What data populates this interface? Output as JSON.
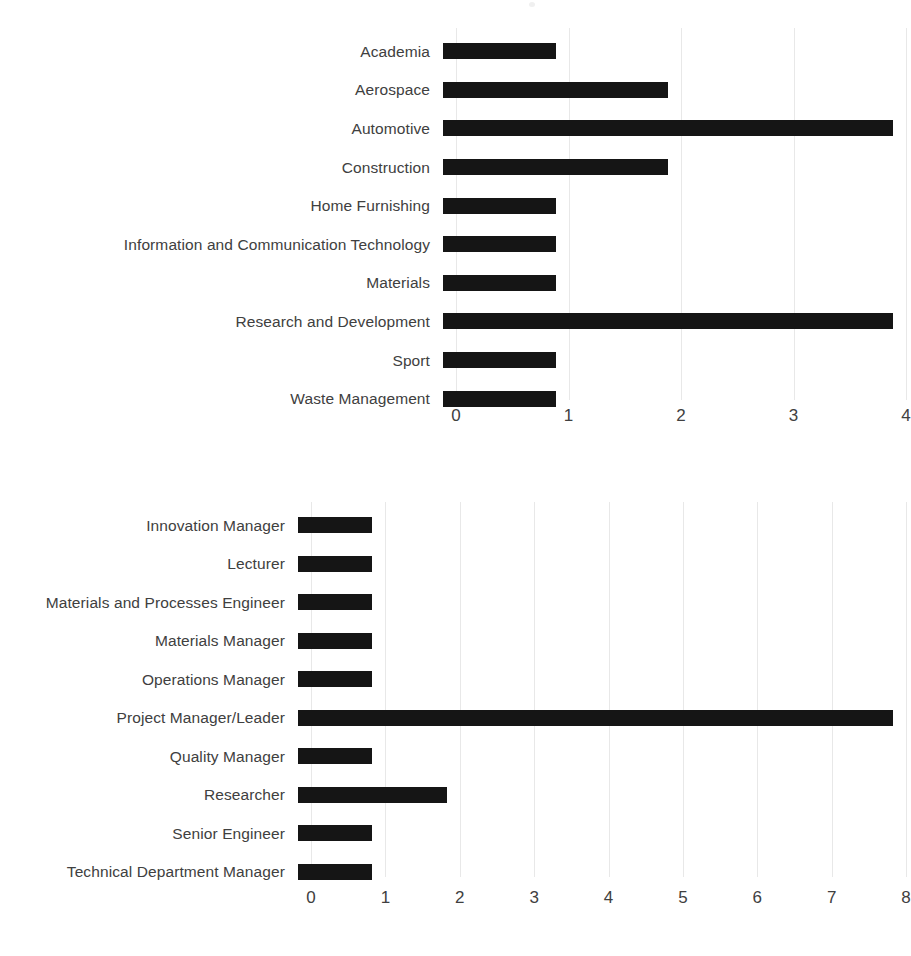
{
  "document": {
    "background_color": "#ffffff",
    "text_color": "#404040",
    "bar_color": "#151515",
    "gridline_color": "#e8e8e8"
  },
  "chart_data": [
    {
      "id": "industry",
      "type": "bar",
      "orientation": "horizontal",
      "title": "",
      "subtitle": "",
      "xlabel": "",
      "ylabel": "",
      "xlim": [
        0,
        4
      ],
      "ylim": null,
      "grid": true,
      "legend": false,
      "legend_position": "none",
      "xticks": [
        "0",
        "1",
        "2",
        "3",
        "4"
      ],
      "xtick_values": [
        0,
        1,
        2,
        3,
        4
      ],
      "categories": [
        "Academia",
        "Aerospace",
        "Automotive",
        "Construction",
        "Home Furnishing",
        "Information and Communication Technology",
        "Materials",
        "Research and Development",
        "Sport",
        "Waste Management"
      ],
      "values": [
        1,
        2,
        4,
        2,
        1,
        1,
        1,
        4,
        1,
        1
      ]
    },
    {
      "id": "role",
      "type": "bar",
      "orientation": "horizontal",
      "title": "",
      "subtitle": "",
      "xlabel": "",
      "ylabel": "",
      "xlim": [
        0,
        8
      ],
      "ylim": null,
      "grid": true,
      "legend": false,
      "legend_position": "none",
      "xticks": [
        "0",
        "1",
        "2",
        "3",
        "4",
        "5",
        "6",
        "7",
        "8"
      ],
      "xtick_values": [
        0,
        1,
        2,
        3,
        4,
        5,
        6,
        7,
        8
      ],
      "categories": [
        "Innovation Manager",
        "Lecturer",
        "Materials and Processes Engineer",
        "Materials Manager",
        "Operations Manager",
        "Project Manager/Leader",
        "Quality Manager",
        "Researcher",
        "Senior Engineer",
        "Technical Department Manager"
      ],
      "values": [
        1,
        1,
        1,
        1,
        1,
        8,
        1,
        2,
        1,
        1
      ]
    }
  ]
}
